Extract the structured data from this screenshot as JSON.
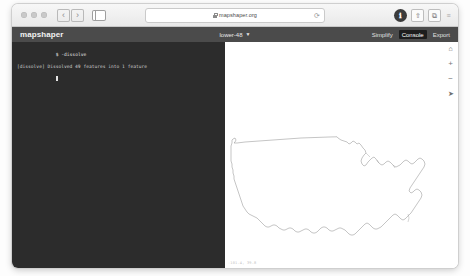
{
  "browser": {
    "traffic_lights": [
      "close",
      "minimize",
      "maximize"
    ],
    "back_label": "‹",
    "forward_label": "›",
    "sidebar_icon": "sidebar-icon",
    "url": "mapshaper.org",
    "lock_icon": "lock-icon",
    "reload_label": "⟳",
    "right_icons": [
      {
        "name": "privacy-report-icon",
        "glyph": "ℹ",
        "style": "dark"
      },
      {
        "name": "share-icon",
        "glyph": "⇧",
        "style": "outline"
      },
      {
        "name": "new-tab-icon",
        "glyph": "⧉",
        "style": "outline"
      },
      {
        "name": "tab-overview-icon",
        "glyph": "≡",
        "style": "plain"
      }
    ]
  },
  "app": {
    "title": "mapshaper",
    "file_name": "lower-48",
    "file_caret": "▼",
    "actions": [
      {
        "label": "Simplify",
        "active": false
      },
      {
        "label": "Console",
        "active": true
      },
      {
        "label": "Export",
        "active": false
      }
    ]
  },
  "console": {
    "prompt_symbol": "$",
    "command": "-dissolve",
    "output": "[dissolve] Dissolved 49 features into 1 feature",
    "prompt_line": "$"
  },
  "map": {
    "toolbar": [
      {
        "name": "home-icon",
        "glyph": "⌂"
      },
      {
        "name": "zoom-in-icon",
        "glyph": "+"
      },
      {
        "name": "zoom-out-icon",
        "glyph": "−"
      },
      {
        "name": "pointer-icon",
        "glyph": "➤"
      }
    ],
    "coordinates": "-101.4, 39.8",
    "layer_name": "lower-48"
  },
  "colors": {
    "header_bg": "#4b4b4b",
    "console_bg": "#2c2c2c",
    "active_button_bg": "#1d1d1d",
    "map_stroke": "#8a8a8a"
  }
}
